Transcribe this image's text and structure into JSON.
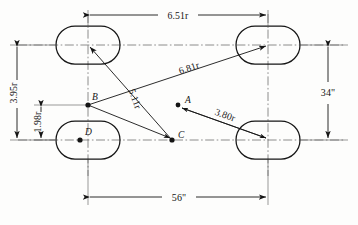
{
  "diagram": {
    "units_note": "r",
    "wheels": [
      {
        "name": "wheel-front-left",
        "cx": 88,
        "cy": 45
      },
      {
        "name": "wheel-front-right",
        "cx": 268,
        "cy": 45
      },
      {
        "name": "wheel-rear-left",
        "cx": 88,
        "cy": 140
      },
      {
        "name": "wheel-rear-right",
        "cx": 268,
        "cy": 140
      }
    ],
    "points": [
      {
        "id": "A",
        "label": "A",
        "cx": 178,
        "cy": 105
      },
      {
        "id": "B",
        "label": "B",
        "cx": 88,
        "cy": 105
      },
      {
        "id": "C",
        "label": "C",
        "cx": 172,
        "cy": 140
      },
      {
        "id": "D",
        "label": "D",
        "cx": 80,
        "cy": 140
      }
    ],
    "dimensions": {
      "top_width": "6.51r",
      "diagonal_long": "6.81r",
      "diagonal_short": "5.11r",
      "radius_a": "3.80r",
      "height_total": "3.95r",
      "height_partial": "1.98r",
      "right_height": "34\"",
      "bottom_width": "56\""
    }
  }
}
